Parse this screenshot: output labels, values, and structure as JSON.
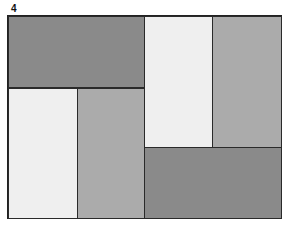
{
  "figure": {
    "label": "4",
    "blocks": [
      {
        "name": "top-left-block",
        "shade": "dark",
        "color": "#8a8a8a"
      },
      {
        "name": "bottom-left-block",
        "shade": "light",
        "color": "#efefef"
      },
      {
        "name": "bottom-middle-block",
        "shade": "medium",
        "color": "#ababab"
      },
      {
        "name": "top-right-light-block",
        "shade": "light",
        "color": "#efefef"
      },
      {
        "name": "top-right-medium-block",
        "shade": "medium",
        "color": "#ababab"
      },
      {
        "name": "bottom-right-block",
        "shade": "dark",
        "color": "#8a8a8a"
      }
    ]
  }
}
